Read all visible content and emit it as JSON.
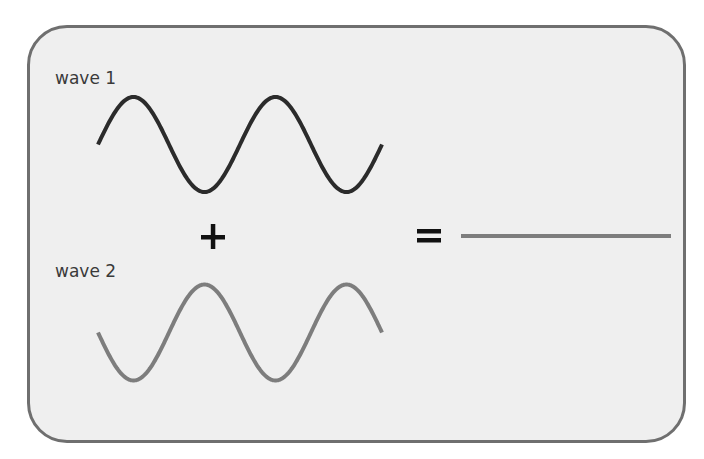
{
  "diagram": {
    "operators": {
      "plus": "+",
      "equals": "="
    },
    "waves": [
      {
        "id": "wave1",
        "label": "wave 1",
        "color": "#2b2b2b",
        "cycles": 2,
        "phase_deg": 0,
        "amplitude": 1
      },
      {
        "id": "wave2",
        "label": "wave 2",
        "color": "#7d7d7d",
        "cycles": 2,
        "phase_deg": 180,
        "amplitude": 1
      }
    ],
    "result": {
      "label": "",
      "color": "#7d7d7d",
      "amplitude": 0,
      "description": "flat line (waves cancel)"
    },
    "colors": {
      "panel_background": "#efefef",
      "panel_border": "#6f6f6f",
      "operator": "#111111",
      "label_text": "#3a3a3a"
    }
  }
}
